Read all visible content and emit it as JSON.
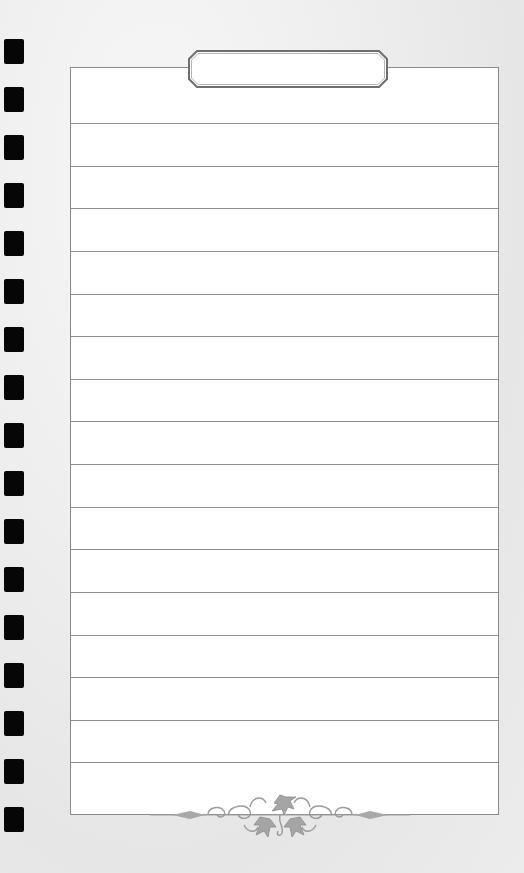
{
  "page": {
    "type": "lined-notebook-page",
    "title_label": "",
    "line_count": 16,
    "hole_count": 17,
    "lines": [
      "",
      "",
      "",
      "",
      "",
      "",
      "",
      "",
      "",
      "",
      "",
      "",
      "",
      "",
      "",
      ""
    ]
  },
  "colors": {
    "background": "#ececec",
    "paper": "#ffffff",
    "rule": "#8c8c8c",
    "hole": "#060606",
    "ornament": "#9a9a9a"
  },
  "icons": {
    "ornament": "floral-vine-flourish"
  }
}
